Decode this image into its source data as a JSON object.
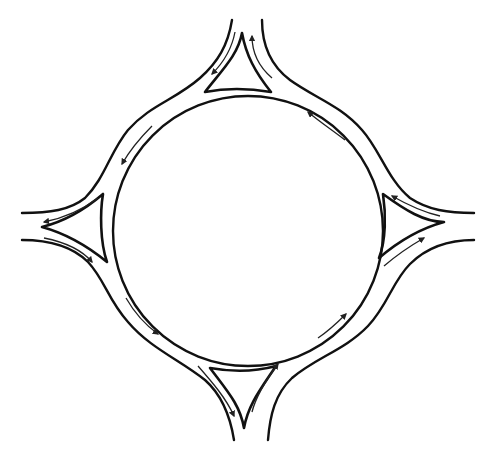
{
  "diagram": {
    "title": "Roundabout with four approach legs and splitter islands",
    "type": "roundabout-plan",
    "stroke_color": "#111111",
    "background": "#ffffff",
    "central_island": {
      "cx": 248,
      "cy": 231,
      "r": 135
    },
    "legs": [
      {
        "id": "north",
        "label": "North approach",
        "entry_arrow": "down-left",
        "exit_arrow": "up"
      },
      {
        "id": "west",
        "label": "West approach",
        "entry_arrow": "right",
        "exit_arrow": "left"
      },
      {
        "id": "south",
        "label": "South approach",
        "entry_arrow": "up-right",
        "exit_arrow": "down"
      },
      {
        "id": "east",
        "label": "East approach",
        "entry_arrow": "up-left",
        "exit_arrow": "right"
      }
    ],
    "circulation": "counter-clockwise",
    "labels": []
  }
}
